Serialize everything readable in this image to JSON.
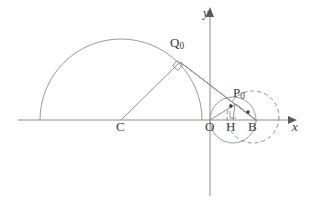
{
  "figure": {
    "background_color": "#ffffff",
    "line_color": "#8c8c8c",
    "dark_line_color": "#707070",
    "label_color": "#3a3a3a",
    "width": 309,
    "height": 207
  },
  "axes": {
    "x_axis_label": "x",
    "y_axis_label": "y",
    "origin_label": "O",
    "x_axis_y": 120,
    "x_axis_start": 18,
    "x_axis_end": 291,
    "y_axis_x": 210,
    "y_axis_top": 12,
    "y_axis_bottom": 196
  },
  "points": [
    {
      "name": "Q0",
      "label": "Q",
      "subscript": "0",
      "x": 180,
      "y": 62,
      "dot": false
    },
    {
      "name": "P0",
      "label": "P",
      "subscript": "0",
      "x": 234,
      "y": 103,
      "dot": true
    },
    {
      "name": "C",
      "label": "C",
      "subscript": "",
      "x": 121,
      "y": 120,
      "dot": false
    },
    {
      "name": "O",
      "label": "O",
      "subscript": "",
      "x": 210,
      "y": 120,
      "dot": false
    },
    {
      "name": "H",
      "label": "H",
      "subscript": "",
      "x": 233,
      "y": 120,
      "dot": false
    },
    {
      "name": "B",
      "label": "B",
      "subscript": "",
      "x": 256,
      "y": 120,
      "dot": true
    }
  ],
  "curves": [
    {
      "name": "large-semicircle",
      "kind": "arc",
      "style": "solid",
      "center_x": 121,
      "center_y": 120,
      "radius": 81,
      "start_angle_deg": 180,
      "end_angle_deg": 0,
      "description": "large arc centred at C passing through the x-axis at both ends"
    },
    {
      "name": "small-solid-circle",
      "kind": "circle",
      "style": "solid",
      "center_x": 233,
      "center_y": 120,
      "radius": 23,
      "description": "solid circle centred at H through O and B"
    },
    {
      "name": "dashed-circle",
      "kind": "circle",
      "style": "dashed",
      "center_x": 253,
      "center_y": 117,
      "radius": 26,
      "description": "dashed circle to the right passing near P0 and B"
    }
  ],
  "segments": [
    {
      "name": "radius-C-Q0",
      "x1": 121,
      "y1": 120,
      "x2": 180,
      "y2": 62
    },
    {
      "name": "tangent-Q0-B",
      "x1": 180,
      "y1": 62,
      "x2": 256,
      "y2": 120
    },
    {
      "name": "chord-Q0-P0",
      "x1": 180,
      "y1": 62,
      "x2": 235,
      "y2": 104
    },
    {
      "name": "segment-O-P0",
      "x1": 210,
      "y1": 120,
      "x2": 235,
      "y2": 104
    },
    {
      "name": "segment-P0-B",
      "x1": 235,
      "y1": 104,
      "x2": 256,
      "y2": 120
    },
    {
      "name": "altitude-P0-H",
      "x1": 235,
      "y1": 104,
      "x2": 233,
      "y2": 120
    }
  ],
  "right_angle_marks": [
    {
      "name": "right-angle-at-Q0",
      "x": 178,
      "y": 66,
      "size": 7,
      "rotation_deg": 38
    },
    {
      "name": "right-angle-at-H",
      "x": 230,
      "y": 112,
      "size": 7,
      "rotation_deg": 0
    }
  ],
  "dots": [
    {
      "name": "dot-P0-foot",
      "x": 231,
      "y": 106,
      "r": 1.7
    },
    {
      "name": "dot-near-B",
      "x": 248,
      "y": 112,
      "r": 1.7
    }
  ],
  "arrowheads": [
    {
      "name": "x-axis-arrowhead",
      "x": 291,
      "y": 120,
      "direction": "right"
    },
    {
      "name": "y-axis-arrowhead",
      "x": 210,
      "y": 12,
      "direction": "up"
    }
  ]
}
